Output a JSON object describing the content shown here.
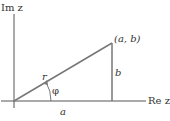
{
  "diagram": {
    "axes": {
      "vertical_label": "Im z",
      "horizontal_label": "Re z"
    },
    "point_label": "(a, b)",
    "hypotenuse_label": "r",
    "angle_label": "φ",
    "base_label": "a",
    "height_label": "b",
    "colors": {
      "axis": "#555555",
      "line": "#777777",
      "text": "#333333"
    }
  }
}
